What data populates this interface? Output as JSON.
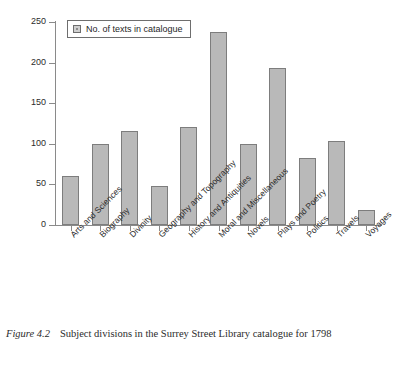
{
  "figure": {
    "number_label": "Figure 4.2",
    "caption_text": "Subject divisions in the Surrey Street Library catalogue for 1798"
  },
  "legend": {
    "entries": [
      "No. of texts in catalogue"
    ],
    "position": "top-left-inside"
  },
  "colors": {
    "bar_fill": "#b9b9b9",
    "bar_stroke": "#7d7d7d",
    "axis": "#8a8a8a",
    "text": "#2b2b2b",
    "background": "#ffffff"
  },
  "chart_data": {
    "type": "bar",
    "title": "",
    "subtitle": "",
    "xlabel": "",
    "ylabel": "",
    "ylim": [
      0,
      250
    ],
    "yticks": [
      0,
      50,
      100,
      150,
      200,
      250
    ],
    "ytick_labels": [
      "0",
      "50",
      "100",
      "150",
      "200",
      "250"
    ],
    "grid": false,
    "legend": [
      "No. of texts in catalogue"
    ],
    "legend_position": "upper left",
    "categories": [
      "Arts and Sciences",
      "Biography",
      "Divinity",
      "Geography and Topography",
      "History and Antiquities",
      "Moral and Miscellaneous",
      "Novels",
      "Plays and Poetry",
      "Politics",
      "Travels",
      "Voyages"
    ],
    "series": [
      {
        "name": "No. of texts in catalogue",
        "values": [
          60,
          100,
          116,
          48,
          121,
          238,
          100,
          193,
          83,
          103,
          19
        ]
      }
    ],
    "values": [
      60,
      100,
      116,
      48,
      121,
      238,
      100,
      193,
      83,
      103,
      19
    ]
  }
}
